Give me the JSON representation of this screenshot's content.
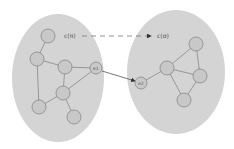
{
  "diagram": {
    "colors": {
      "cluster_fill": "#d4d4d4",
      "node_fill": "#c8c8c8",
      "node_stroke": "#888888",
      "edge": "#888888",
      "label": "#555555",
      "arrow": "#333333"
    },
    "clusters": [
      {
        "id": "left",
        "cx": 58,
        "cy": 78,
        "rx": 46,
        "ry": 64
      },
      {
        "id": "right",
        "cx": 176,
        "cy": 72,
        "rx": 49,
        "ry": 62
      }
    ],
    "labels": {
      "left_cluster": "c(π)",
      "right_cluster": "c(σ)",
      "node_e1": "e1",
      "node_e2": "e2"
    },
    "nodes": [
      {
        "id": "n1",
        "x": 48,
        "y": 36
      },
      {
        "id": "n2",
        "x": 37,
        "y": 59
      },
      {
        "id": "n3",
        "x": 65,
        "y": 67
      },
      {
        "id": "e1",
        "x": 96,
        "y": 68
      },
      {
        "id": "n5",
        "x": 63,
        "y": 93
      },
      {
        "id": "n6",
        "x": 39,
        "y": 107
      },
      {
        "id": "n7",
        "x": 74,
        "y": 117
      },
      {
        "id": "e2",
        "x": 141,
        "y": 83
      },
      {
        "id": "m1",
        "x": 196,
        "y": 44
      },
      {
        "id": "m2",
        "x": 167,
        "y": 68
      },
      {
        "id": "m3",
        "x": 200,
        "y": 76
      },
      {
        "id": "m4",
        "x": 184,
        "y": 100
      }
    ],
    "edges": [
      [
        "n1",
        "n2"
      ],
      [
        "n2",
        "n3"
      ],
      [
        "n3",
        "e1"
      ],
      [
        "n2",
        "n6"
      ],
      [
        "n3",
        "n5"
      ],
      [
        "n5",
        "e1"
      ],
      [
        "n5",
        "n6"
      ],
      [
        "n5",
        "n7"
      ],
      [
        "e2",
        "m2"
      ],
      [
        "m2",
        "m1"
      ],
      [
        "m2",
        "m3"
      ],
      [
        "m1",
        "m3"
      ],
      [
        "m2",
        "m4"
      ],
      [
        "m3",
        "m4"
      ]
    ],
    "arrows": [
      {
        "id": "cross-edge",
        "from": "e1",
        "to": "e2",
        "style": "solid"
      },
      {
        "id": "cluster-map",
        "from_label": "c(π)",
        "to_label": "c(σ)",
        "style": "dashed"
      }
    ]
  }
}
